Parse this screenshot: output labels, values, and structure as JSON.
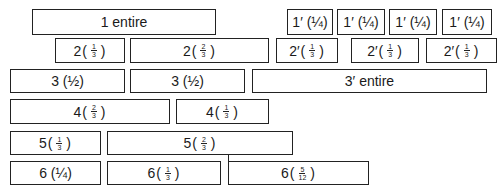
{
  "diagram": {
    "rows": [
      {
        "row": 1,
        "boxes": [
          {
            "id": "1",
            "label": "1 entire",
            "x": 32,
            "y": 9,
            "w": 184,
            "h": 26
          },
          {
            "id": "1p-a",
            "label": "1′ (¼)",
            "x": 287,
            "y": 9,
            "w": 46,
            "h": 26
          },
          {
            "id": "1p-b",
            "label": "1′ (¼)",
            "x": 337,
            "y": 9,
            "w": 48,
            "h": 26
          },
          {
            "id": "1p-c",
            "label": "1′ (¼)",
            "x": 389,
            "y": 9,
            "w": 48,
            "h": 26
          },
          {
            "id": "1p-d",
            "label": "1′ (¼)",
            "x": 442,
            "y": 9,
            "w": 50,
            "h": 26
          }
        ]
      },
      {
        "row": 2,
        "boxes": [
          {
            "id": "2a",
            "prefix": "2",
            "num": "1",
            "den": "3",
            "x": 55,
            "y": 38,
            "w": 70,
            "h": 25
          },
          {
            "id": "2b",
            "prefix": "2",
            "num": "2",
            "den": "3",
            "x": 130,
            "y": 38,
            "w": 139,
            "h": 25
          },
          {
            "id": "2p-a",
            "prefix": "2′",
            "num": "1",
            "den": "3",
            "x": 276,
            "y": 38,
            "w": 62,
            "h": 25
          },
          {
            "id": "2p-b",
            "prefix": "2′",
            "num": "1",
            "den": "3",
            "x": 351,
            "y": 38,
            "w": 68,
            "h": 25
          },
          {
            "id": "2p-c",
            "prefix": "2′",
            "num": "1",
            "den": "3",
            "x": 426,
            "y": 38,
            "w": 71,
            "h": 25
          }
        ]
      },
      {
        "row": 3,
        "boxes": [
          {
            "id": "3a",
            "label": "3 (½)",
            "x": 10,
            "y": 69,
            "w": 115,
            "h": 24
          },
          {
            "id": "3b",
            "label": "3 (½)",
            "x": 130,
            "y": 69,
            "w": 115,
            "h": 24
          },
          {
            "id": "3p",
            "label": "3′ entire",
            "x": 252,
            "y": 69,
            "w": 235,
            "h": 24
          }
        ]
      },
      {
        "row": 4,
        "boxes": [
          {
            "id": "4a",
            "prefix": "4",
            "num": "2",
            "den": "3",
            "x": 10,
            "y": 99,
            "w": 160,
            "h": 25
          },
          {
            "id": "4b",
            "prefix": "4",
            "num": "1",
            "den": "3",
            "x": 176,
            "y": 99,
            "w": 93,
            "h": 25
          }
        ]
      },
      {
        "row": 5,
        "boxes": [
          {
            "id": "5a",
            "prefix": "5",
            "num": "1",
            "den": "3",
            "x": 10,
            "y": 131,
            "w": 91,
            "h": 24
          },
          {
            "id": "5b",
            "prefix": "5",
            "num": "2",
            "den": "3",
            "x": 107,
            "y": 131,
            "w": 186,
            "h": 24
          }
        ]
      },
      {
        "row": 6,
        "boxes": [
          {
            "id": "6a",
            "label": "6 (¼)",
            "x": 10,
            "y": 161,
            "w": 91,
            "h": 24
          },
          {
            "id": "6b",
            "prefix": "6",
            "num": "1",
            "den": "3",
            "x": 107,
            "y": 161,
            "w": 114,
            "h": 24
          },
          {
            "id": "6c",
            "prefix": "6",
            "num": "5",
            "den": "12",
            "x": 228,
            "y": 161,
            "w": 141,
            "h": 24
          }
        ]
      }
    ],
    "connector": {
      "x": 228,
      "y1": 155,
      "y2": 161
    }
  }
}
